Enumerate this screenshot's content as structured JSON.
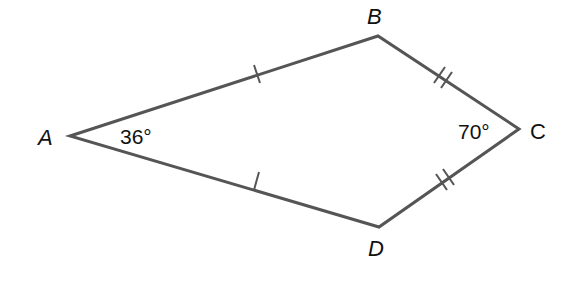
{
  "figure": {
    "type": "kite",
    "stroke_color": "#555555",
    "vertices": [
      {
        "name": "A",
        "x": 70,
        "y": 136
      },
      {
        "name": "B",
        "x": 378,
        "y": 36
      },
      {
        "name": "C",
        "x": 519,
        "y": 129
      },
      {
        "name": "D",
        "x": 379,
        "y": 227
      }
    ],
    "labels": {
      "A": "A",
      "B": "B",
      "C": "C",
      "D": "D"
    },
    "angles": {
      "A": "36°",
      "C": "70°"
    },
    "tick_marks": {
      "AB": 1,
      "AD": 1,
      "BC": 2,
      "CD": 2
    }
  }
}
